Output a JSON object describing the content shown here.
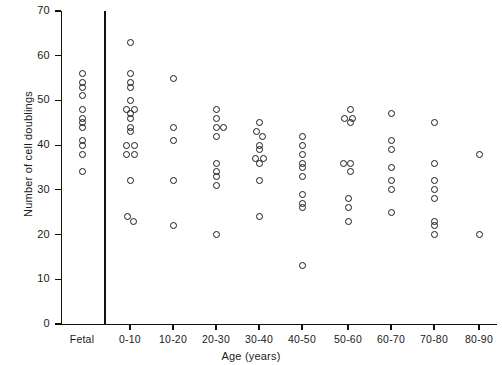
{
  "chart_data": {
    "type": "scatter",
    "title": "",
    "xlabel": "Age (years)",
    "ylabel": "Number of cell doublings",
    "ylim": [
      0,
      70
    ],
    "y_ticks": [
      0,
      10,
      20,
      30,
      40,
      50,
      60,
      70
    ],
    "y_tick_labels": [
      "0",
      "10",
      "20",
      "30",
      "40",
      "50",
      "60",
      "70"
    ],
    "grid": false,
    "legend": "none",
    "categories": [
      "Fetal",
      "0-10",
      "10-20",
      "20-30",
      "30-40",
      "40-50",
      "50-60",
      "60-70",
      "70-80",
      "80-90"
    ],
    "series": [
      {
        "name": "Fetal",
        "category": "Fetal",
        "points": [
          {
            "x_offset": 0,
            "value": 56
          },
          {
            "x_offset": 0,
            "value": 54
          },
          {
            "x_offset": 0,
            "value": 53
          },
          {
            "x_offset": 0,
            "value": 51
          },
          {
            "x_offset": 0,
            "value": 48
          },
          {
            "x_offset": 0,
            "value": 46
          },
          {
            "x_offset": 0,
            "value": 45
          },
          {
            "x_offset": 0,
            "value": 44
          },
          {
            "x_offset": 0,
            "value": 41
          },
          {
            "x_offset": 0,
            "value": 40
          },
          {
            "x_offset": 0,
            "value": 38
          },
          {
            "x_offset": 0,
            "value": 34
          }
        ]
      },
      {
        "name": "0-10",
        "category": "0-10",
        "points": [
          {
            "x_offset": 0,
            "value": 63
          },
          {
            "x_offset": 0,
            "value": 56
          },
          {
            "x_offset": 0,
            "value": 54
          },
          {
            "x_offset": 0,
            "value": 53
          },
          {
            "x_offset": 0,
            "value": 50
          },
          {
            "x_offset": -4,
            "value": 48
          },
          {
            "x_offset": 4,
            "value": 48
          },
          {
            "x_offset": 0,
            "value": 47
          },
          {
            "x_offset": 0,
            "value": 46
          },
          {
            "x_offset": 0,
            "value": 44
          },
          {
            "x_offset": 0,
            "value": 43
          },
          {
            "x_offset": -4,
            "value": 40
          },
          {
            "x_offset": 4,
            "value": 40
          },
          {
            "x_offset": -4,
            "value": 38
          },
          {
            "x_offset": 4,
            "value": 38
          },
          {
            "x_offset": 0,
            "value": 32
          },
          {
            "x_offset": -3,
            "value": 24
          },
          {
            "x_offset": 3,
            "value": 23
          }
        ]
      },
      {
        "name": "10-20",
        "category": "10-20",
        "points": [
          {
            "x_offset": 0,
            "value": 55
          },
          {
            "x_offset": 0,
            "value": 44
          },
          {
            "x_offset": 0,
            "value": 41
          },
          {
            "x_offset": 0,
            "value": 32
          },
          {
            "x_offset": 0,
            "value": 22
          }
        ]
      },
      {
        "name": "20-30",
        "category": "20-30",
        "points": [
          {
            "x_offset": 0,
            "value": 48
          },
          {
            "x_offset": 0,
            "value": 46
          },
          {
            "x_offset": 0,
            "value": 44
          },
          {
            "x_offset": 7,
            "value": 44
          },
          {
            "x_offset": 0,
            "value": 42
          },
          {
            "x_offset": 0,
            "value": 36
          },
          {
            "x_offset": 0,
            "value": 34
          },
          {
            "x_offset": 0,
            "value": 33
          },
          {
            "x_offset": 0,
            "value": 31
          },
          {
            "x_offset": 0,
            "value": 20
          }
        ]
      },
      {
        "name": "30-40",
        "category": "30-40",
        "points": [
          {
            "x_offset": 0,
            "value": 45
          },
          {
            "x_offset": -3,
            "value": 43
          },
          {
            "x_offset": 3,
            "value": 42
          },
          {
            "x_offset": 0,
            "value": 40
          },
          {
            "x_offset": 0,
            "value": 39
          },
          {
            "x_offset": -4,
            "value": 37
          },
          {
            "x_offset": 4,
            "value": 37
          },
          {
            "x_offset": 0,
            "value": 36
          },
          {
            "x_offset": 0,
            "value": 32
          },
          {
            "x_offset": 0,
            "value": 24
          }
        ]
      },
      {
        "name": "40-50",
        "category": "40-50",
        "points": [
          {
            "x_offset": 0,
            "value": 42
          },
          {
            "x_offset": 0,
            "value": 40
          },
          {
            "x_offset": 0,
            "value": 38
          },
          {
            "x_offset": 0,
            "value": 36
          },
          {
            "x_offset": 0,
            "value": 35
          },
          {
            "x_offset": 0,
            "value": 33
          },
          {
            "x_offset": 0,
            "value": 29
          },
          {
            "x_offset": 0,
            "value": 27
          },
          {
            "x_offset": 0,
            "value": 26
          },
          {
            "x_offset": 0,
            "value": 13
          }
        ]
      },
      {
        "name": "50-60",
        "category": "50-60",
        "points": [
          {
            "x_offset": 2,
            "value": 48
          },
          {
            "x_offset": -4,
            "value": 46
          },
          {
            "x_offset": 4,
            "value": 46
          },
          {
            "x_offset": 2,
            "value": 45
          },
          {
            "x_offset": -5,
            "value": 36
          },
          {
            "x_offset": 2,
            "value": 36
          },
          {
            "x_offset": 2,
            "value": 34
          },
          {
            "x_offset": 0,
            "value": 28
          },
          {
            "x_offset": 0,
            "value": 26
          },
          {
            "x_offset": 0,
            "value": 23
          }
        ]
      },
      {
        "name": "60-70",
        "category": "60-70",
        "points": [
          {
            "x_offset": 0,
            "value": 47
          },
          {
            "x_offset": 0,
            "value": 41
          },
          {
            "x_offset": 0,
            "value": 39
          },
          {
            "x_offset": 0,
            "value": 35
          },
          {
            "x_offset": 0,
            "value": 32
          },
          {
            "x_offset": 0,
            "value": 30
          },
          {
            "x_offset": 0,
            "value": 25
          }
        ]
      },
      {
        "name": "70-80",
        "category": "70-80",
        "points": [
          {
            "x_offset": 0,
            "value": 45
          },
          {
            "x_offset": 0,
            "value": 36
          },
          {
            "x_offset": 0,
            "value": 32
          },
          {
            "x_offset": 0,
            "value": 30
          },
          {
            "x_offset": 0,
            "value": 28
          },
          {
            "x_offset": 0,
            "value": 23
          },
          {
            "x_offset": 0,
            "value": 22
          },
          {
            "x_offset": 0,
            "value": 20
          }
        ]
      },
      {
        "name": "80-90",
        "category": "80-90",
        "points": [
          {
            "x_offset": 0,
            "value": 38
          },
          {
            "x_offset": 0,
            "value": 20
          }
        ]
      }
    ]
  }
}
